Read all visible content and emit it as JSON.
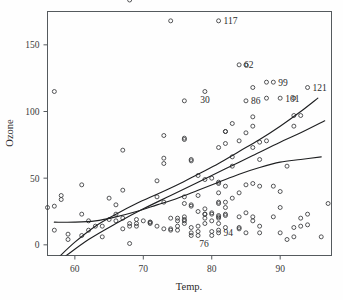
{
  "chart_data": {
    "type": "scatter",
    "title": "",
    "xlabel": "Temp.",
    "ylabel": "Ozone",
    "xlim": [
      56,
      97.5
    ],
    "ylim": [
      -8,
      175
    ],
    "grid": false,
    "legend": "none",
    "xticks": [
      60,
      70,
      80,
      90
    ],
    "yticks": [
      0,
      50,
      100,
      150
    ],
    "x": [
      67,
      72,
      74,
      62,
      56,
      66,
      65,
      59,
      61,
      69,
      74,
      69,
      66,
      68,
      58,
      64,
      66,
      57,
      68,
      62,
      59,
      73,
      61,
      61,
      57,
      58,
      57,
      67,
      81,
      79,
      76,
      78,
      74,
      67,
      84,
      85,
      79,
      82,
      87,
      90,
      87,
      93,
      92,
      82,
      80,
      79,
      77,
      72,
      65,
      73,
      76,
      77,
      76,
      76,
      76,
      75,
      78,
      73,
      80,
      77,
      83,
      84,
      85,
      81,
      84,
      83,
      83,
      88,
      92,
      92,
      89,
      82,
      73,
      81,
      91,
      80,
      81,
      82,
      84,
      87,
      85,
      74,
      81,
      82,
      86,
      85,
      82,
      86,
      88,
      86,
      83,
      81,
      81,
      81,
      82,
      86,
      85,
      87,
      89,
      90,
      90,
      92,
      86,
      86,
      82,
      80,
      79,
      77,
      79,
      76,
      78,
      78,
      77,
      72,
      75,
      79,
      81,
      86,
      88,
      97,
      94,
      96,
      94,
      91,
      92,
      93,
      93,
      87,
      84,
      80,
      78,
      75,
      73,
      81,
      76,
      77,
      71,
      71,
      78,
      67,
      76,
      68,
      82,
      64,
      71,
      81,
      69,
      63,
      70,
      77,
      75,
      76,
      68
    ],
    "y": [
      41,
      36,
      12,
      18,
      28,
      23,
      19,
      8,
      7,
      16,
      11,
      14,
      18,
      14,
      34,
      6,
      30,
      11,
      1,
      11,
      4,
      32,
      23,
      45,
      115,
      37,
      29,
      71,
      39,
      23,
      21,
      37,
      20,
      12,
      13,
      135,
      49,
      32,
      64,
      40,
      77,
      97,
      97,
      85,
      10,
      27,
      7,
      48,
      35,
      61,
      79,
      63,
      16,
      80,
      108,
      20,
      52,
      82,
      50,
      64,
      59,
      39,
      9,
      16,
      78,
      35,
      66,
      122,
      89,
      110,
      44,
      28,
      65,
      22,
      59,
      23,
      31,
      44,
      21,
      9,
      45,
      168,
      73,
      76,
      118,
      84,
      85,
      96,
      78,
      73,
      91,
      47,
      32,
      20,
      23,
      21,
      24,
      44,
      21,
      28,
      9,
      13,
      46,
      18,
      13,
      24,
      16,
      13,
      23,
      36,
      7,
      14,
      30,
      14,
      18,
      20,
      46,
      89,
      110,
      31,
      23,
      6,
      15,
      4,
      6,
      14,
      20,
      14,
      12,
      18,
      10,
      11,
      12,
      21,
      19,
      29,
      17,
      17,
      25,
      20,
      18,
      16,
      22,
      14,
      16,
      11,
      19,
      14,
      18,
      9,
      14,
      31
    ],
    "labeled_points": [
      {
        "label": "117",
        "x": 81,
        "y": 168,
        "placement": "right"
      },
      {
        "label": "62",
        "x": 84,
        "y": 135,
        "placement": "right"
      },
      {
        "label": "99",
        "x": 89,
        "y": 122,
        "placement": "right"
      },
      {
        "label": "121",
        "x": 94,
        "y": 118,
        "placement": "right"
      },
      {
        "label": "30",
        "x": 79,
        "y": 115,
        "placement": "below"
      },
      {
        "label": "86",
        "x": 85,
        "y": 108,
        "placement": "right"
      },
      {
        "label": "101",
        "x": 90,
        "y": 110,
        "placement": "right"
      },
      {
        "label": "94",
        "x": 81,
        "y": 9,
        "placement": "right"
      },
      {
        "label": "76",
        "x": 80,
        "y": 7,
        "placement": "below-left"
      }
    ],
    "series": [
      {
        "name": "lowess-upper-fit",
        "type": "curve",
        "points": [
          [
            57.5,
            -10
          ],
          [
            60,
            2
          ],
          [
            63,
            14
          ],
          [
            66,
            23
          ],
          [
            69,
            31
          ],
          [
            72,
            38
          ],
          [
            75,
            45
          ],
          [
            78,
            53
          ],
          [
            81,
            61
          ],
          [
            84,
            70
          ],
          [
            87,
            79
          ],
          [
            90,
            89
          ],
          [
            93,
            100
          ],
          [
            95.5,
            110
          ]
        ]
      },
      {
        "name": "linear-fit",
        "type": "curve",
        "points": [
          [
            58.5,
            -9
          ],
          [
            62,
            4
          ],
          [
            66,
            16
          ],
          [
            70,
            27
          ],
          [
            74,
            37
          ],
          [
            78,
            47
          ],
          [
            82,
            57
          ],
          [
            86,
            67
          ],
          [
            90,
            77
          ],
          [
            93,
            84
          ],
          [
            96.5,
            93
          ]
        ]
      },
      {
        "name": "lowess-flat-fit",
        "type": "curve",
        "points": [
          [
            57,
            17
          ],
          [
            60,
            17
          ],
          [
            63,
            18
          ],
          [
            66,
            21
          ],
          [
            69,
            25
          ],
          [
            72,
            30
          ],
          [
            75,
            35
          ],
          [
            78,
            41
          ],
          [
            81,
            47
          ],
          [
            84,
            53
          ],
          [
            87,
            58
          ],
          [
            90,
            62
          ],
          [
            93,
            64
          ],
          [
            96,
            66
          ]
        ]
      }
    ]
  },
  "axes": {
    "x_title": "Temp.",
    "y_title": "Ozone",
    "x_tick_labels": [
      "60",
      "70",
      "80",
      "90"
    ],
    "y_tick_labels": [
      "0",
      "50",
      "100",
      "150"
    ]
  },
  "style": {
    "frame_color": "#555a5e",
    "point_color": "#38393b",
    "curve_color": "#1f2022",
    "text_color": "#2b2b2b",
    "background": "#fefefe"
  }
}
